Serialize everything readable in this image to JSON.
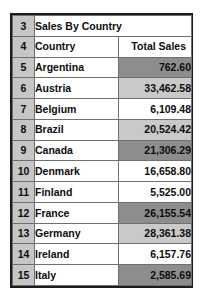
{
  "sheet": {
    "title_row": {
      "row_number": "3",
      "text": "Sales By Country"
    },
    "header_row": {
      "row_number": "4",
      "country_label": "Country",
      "sales_label": "Total Sales"
    },
    "rows": [
      {
        "row_number": "5",
        "country": "Argentina",
        "sales": "762.60",
        "fill": "dark"
      },
      {
        "row_number": "6",
        "country": "Austria",
        "sales": "33,462.58",
        "fill": "light"
      },
      {
        "row_number": "7",
        "country": "Belgium",
        "sales": "6,109.48",
        "fill": "none"
      },
      {
        "row_number": "8",
        "country": "Brazil",
        "sales": "20,524.42",
        "fill": "light"
      },
      {
        "row_number": "9",
        "country": "Canada",
        "sales": "21,306.29",
        "fill": "dark"
      },
      {
        "row_number": "10",
        "country": "Denmark",
        "sales": "16,658.80",
        "fill": "none"
      },
      {
        "row_number": "11",
        "country": "Finland",
        "sales": "5,525.00",
        "fill": "none"
      },
      {
        "row_number": "12",
        "country": "France",
        "sales": "26,155.54",
        "fill": "dark"
      },
      {
        "row_number": "13",
        "country": "Germany",
        "sales": "28,361.38",
        "fill": "light"
      },
      {
        "row_number": "14",
        "country": "Ireland",
        "sales": "6,157.76",
        "fill": "none"
      },
      {
        "row_number": "15",
        "country": "Italy",
        "sales": "2,585.69",
        "fill": "dark"
      }
    ],
    "colors": {
      "gutter_background": "#c6c6c6",
      "fill_dark": "#8d8d8d",
      "fill_light": "#c9c9c9",
      "cell_background": "#ffffff",
      "gridline": "#6f6f6f",
      "outer_border": "#1c1c1c"
    }
  }
}
